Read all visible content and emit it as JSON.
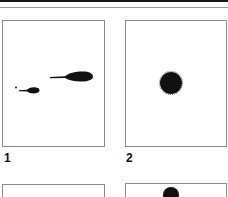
{
  "figure": {
    "panels": [
      {
        "id": 1,
        "label": "1",
        "description": "two comet-shaped spots with tails plus a small speck"
      },
      {
        "id": 2,
        "label": "2",
        "description": "single round dense spot"
      },
      {
        "id": 3,
        "label": "",
        "description": "empty panel (partially visible)"
      },
      {
        "id": 4,
        "label": "",
        "description": "panel with dark spot at top (partially visible)"
      }
    ],
    "colors": {
      "ink": "#111111",
      "border": "#8a8a8a",
      "background": "#ffffff"
    }
  }
}
